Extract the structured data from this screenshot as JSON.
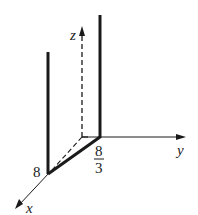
{
  "diagram": {
    "type": "3d-axes",
    "axes": {
      "x": {
        "label": "x"
      },
      "y": {
        "label": "y"
      },
      "z": {
        "label": "z"
      }
    },
    "points": {
      "x_intercept": {
        "label": "8"
      },
      "y_intercept": {
        "numerator": "8",
        "denominator": "3"
      }
    },
    "elements": [
      "dashed z-axis with arrow",
      "solid y-axis with arrow",
      "solid x-axis with arrow",
      "thick segment from x=8 to y=8/3 in xy-plane",
      "dashed segment from origin to x=8",
      "thick vertical line at x=8",
      "thick vertical line at y=8/3"
    ],
    "colors": {
      "stroke": "#1a1a1a",
      "background": "#ffffff"
    }
  }
}
